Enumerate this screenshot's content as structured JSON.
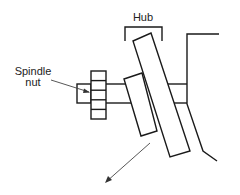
{
  "diagram": {
    "type": "mechanical-cross-section",
    "labels": {
      "hub": "Hub",
      "spindle_nut_line1": "Spindle",
      "spindle_nut_line2": "nut"
    },
    "components": [
      {
        "id": "spindle-end",
        "shape": "rectangle"
      },
      {
        "id": "spindle-nut",
        "shape": "castellated-nut",
        "segments": 5
      },
      {
        "id": "spindle-shaft",
        "shape": "parallel-lines"
      },
      {
        "id": "hub-body",
        "shape": "tilted-rectangle"
      },
      {
        "id": "rotor",
        "shape": "tilted-rectangle"
      },
      {
        "id": "steering-knuckle",
        "shape": "polyline"
      },
      {
        "id": "hub-bracket",
        "shape": "bracket"
      },
      {
        "id": "direction-arrow",
        "shape": "arrow"
      }
    ],
    "colors": {
      "stroke": "#1a1a1a",
      "background": "#ffffff",
      "text": "#222222"
    }
  }
}
